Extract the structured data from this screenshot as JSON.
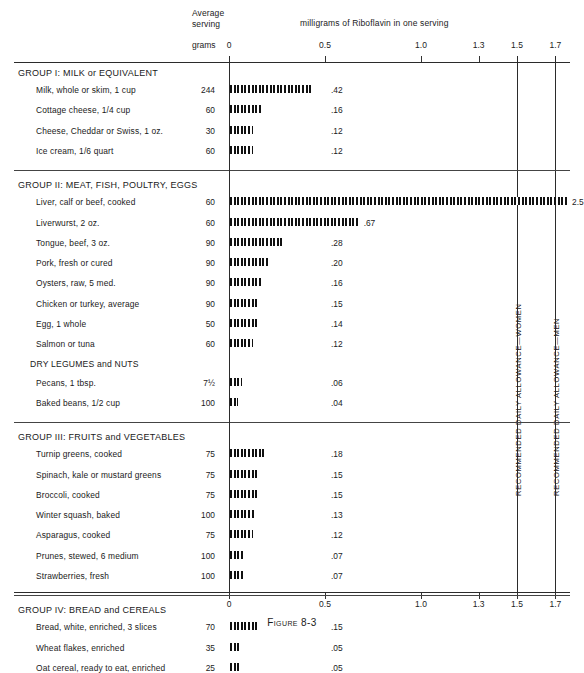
{
  "figure": {
    "caption": "Figure 8-3"
  },
  "header": {
    "average_serving_line1": "Average",
    "average_serving_line2": "serving",
    "grams_label": "grams",
    "units_title": "milligrams of Riboflavin in one serving"
  },
  "axis": {
    "ticks": [
      {
        "value": 0,
        "label": "0"
      },
      {
        "value": 0.5,
        "label": "0.5"
      },
      {
        "value": 1.0,
        "label": "1.0"
      },
      {
        "value": 1.3,
        "label": "1.3"
      },
      {
        "value": 1.5,
        "label": "1.5"
      },
      {
        "value": 1.7,
        "label": "1.7"
      }
    ],
    "bottom_ticks": [
      {
        "value": 0,
        "label": "0"
      },
      {
        "value": 0.5,
        "label": "0.5"
      },
      {
        "value": 1.0,
        "label": "1.0"
      },
      {
        "value": 1.3,
        "label": "1.3"
      },
      {
        "value": 1.5,
        "label": "1.5"
      },
      {
        "value": 1.7,
        "label": "1.7"
      }
    ]
  },
  "reference_lines": [
    {
      "value": 1.5,
      "label": "RECOMMENDED DAILY ALLOWANCE—WOMEN"
    },
    {
      "value": 1.7,
      "label": "RECOMMENDED DAILY ALLOWANCE—MEN"
    }
  ],
  "chart_data": {
    "type": "bar",
    "orientation": "horizontal",
    "title": "milligrams of Riboflavin in one serving",
    "xlabel": "milligrams of Riboflavin in one serving",
    "ylabel": "",
    "xlim": [
      0,
      1.8
    ],
    "grid": false,
    "legend": "none",
    "value_axis_ticks": [
      0,
      0.5,
      1.0,
      1.3,
      1.5,
      1.7
    ],
    "reference_lines": [
      {
        "value": 1.5,
        "label": "RECOMMENDED DAILY ALLOWANCE—WOMEN"
      },
      {
        "value": 1.7,
        "label": "RECOMMENDED DAILY ALLOWANCE—MEN"
      }
    ],
    "columns": [
      "Food",
      "Average serving (grams)",
      "Riboflavin (mg)"
    ],
    "groups": [
      {
        "heading": "GROUP I:  MILK or EQUIVALENT",
        "subheading": null,
        "rows": [
          {
            "food": "Milk, whole or skim, 1 cup",
            "grams": "244",
            "value": 0.42,
            "value_label": ".42"
          },
          {
            "food": "Cottage cheese, 1/4 cup",
            "grams": "60",
            "value": 0.16,
            "value_label": ".16"
          },
          {
            "food": "Cheese, Cheddar or Swiss, 1 oz.",
            "grams": "30",
            "value": 0.12,
            "value_label": ".12"
          },
          {
            "food": "Ice cream, 1/6 quart",
            "grams": "60",
            "value": 0.12,
            "value_label": ".12"
          }
        ]
      },
      {
        "heading": "GROUP II:  MEAT, FISH, POULTRY, EGGS",
        "subheading": null,
        "rows": [
          {
            "food": "Liver, calf or beef, cooked",
            "grams": "60",
            "value": 2.5,
            "value_label": "2.5",
            "clipped": true
          },
          {
            "food": "Liverwurst, 2 oz.",
            "grams": "60",
            "value": 0.67,
            "value_label": ".67"
          },
          {
            "food": "Tongue, beef, 3 oz.",
            "grams": "90",
            "value": 0.28,
            "value_label": ".28"
          },
          {
            "food": "Pork, fresh or cured",
            "grams": "90",
            "value": 0.2,
            "value_label": ".20"
          },
          {
            "food": "Oysters, raw, 5 med.",
            "grams": "90",
            "value": 0.16,
            "value_label": ".16"
          },
          {
            "food": "Chicken or turkey, average",
            "grams": "90",
            "value": 0.15,
            "value_label": ".15"
          },
          {
            "food": "Egg, 1 whole",
            "grams": "50",
            "value": 0.14,
            "value_label": ".14"
          },
          {
            "food": "Salmon or tuna",
            "grams": "60",
            "value": 0.12,
            "value_label": ".12"
          }
        ]
      },
      {
        "heading": null,
        "subheading": "DRY LEGUMES and NUTS",
        "rows": [
          {
            "food": "Pecans, 1 tbsp.",
            "grams": "7½",
            "value": 0.06,
            "value_label": ".06"
          },
          {
            "food": "Baked beans, 1/2 cup",
            "grams": "100",
            "value": 0.04,
            "value_label": ".04"
          }
        ]
      },
      {
        "heading": "GROUP III:  FRUITS and VEGETABLES",
        "subheading": null,
        "rows": [
          {
            "food": "Turnip greens, cooked",
            "grams": "75",
            "value": 0.18,
            "value_label": ".18"
          },
          {
            "food": "Spinach, kale or mustard greens",
            "grams": "75",
            "value": 0.15,
            "value_label": ".15"
          },
          {
            "food": "Broccoli, cooked",
            "grams": "75",
            "value": 0.15,
            "value_label": ".15"
          },
          {
            "food": "Winter squash, baked",
            "grams": "100",
            "value": 0.13,
            "value_label": ".13"
          },
          {
            "food": "Asparagus, cooked",
            "grams": "75",
            "value": 0.12,
            "value_label": ".12"
          },
          {
            "food": "Prunes, stewed, 6 medium",
            "grams": "100",
            "value": 0.07,
            "value_label": ".07"
          },
          {
            "food": "Strawberries, fresh",
            "grams": "100",
            "value": 0.07,
            "value_label": ".07"
          }
        ]
      },
      {
        "heading": "GROUP IV:  BREAD and CEREALS",
        "subheading": null,
        "rows": [
          {
            "food": "Bread, white, enriched, 3 slices",
            "grams": "70",
            "value": 0.15,
            "value_label": ".15"
          },
          {
            "food": "Wheat flakes, enriched",
            "grams": "35",
            "value": 0.05,
            "value_label": ".05"
          },
          {
            "food": "Oat cereal, ready to eat, enriched",
            "grams": "25",
            "value": 0.05,
            "value_label": ".05"
          }
        ]
      }
    ]
  }
}
